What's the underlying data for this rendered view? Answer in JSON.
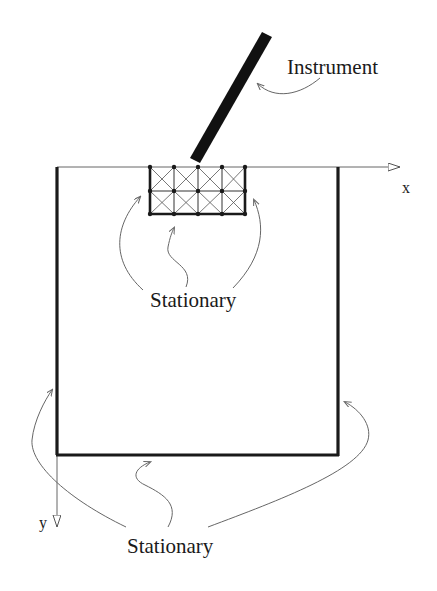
{
  "labels": {
    "instrument": "Instrument",
    "stationary_top": "Stationary",
    "stationary_bottom": "Stationary",
    "x_axis": "x",
    "y_axis": "y"
  },
  "colors": {
    "line": "#1a1a1a",
    "thin_line": "#777777",
    "background": "#ffffff"
  },
  "mesh": {
    "columns": 4,
    "rows": 2
  }
}
